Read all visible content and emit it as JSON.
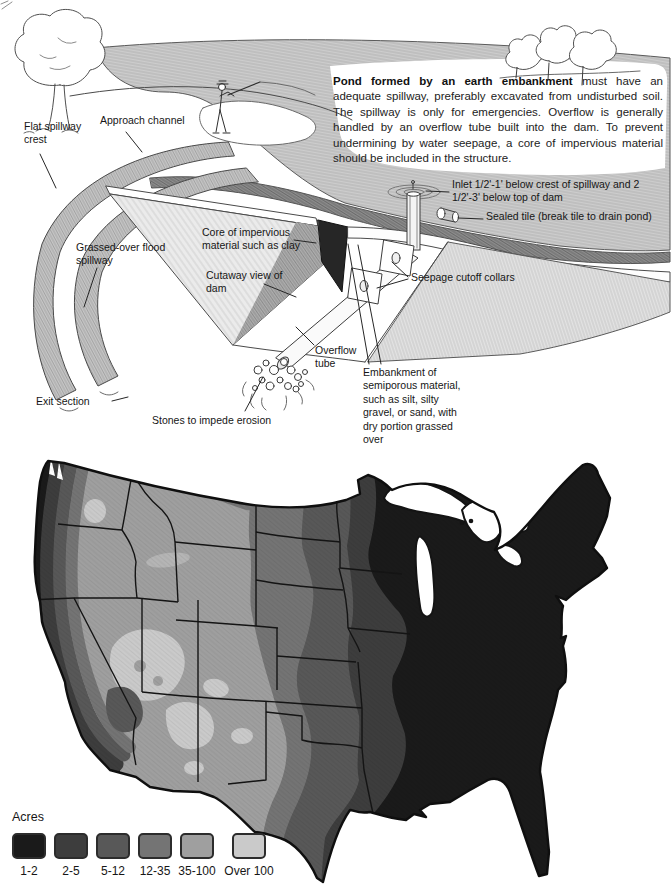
{
  "figure": {
    "caption": {
      "lead": "Pond formed by an earth embankment",
      "body": " must have an adequate spillway, preferably excavated from undisturbed soil. The spillway is only for emergencies. Overflow is generally handled by an overflow tube built into the dam. To prevent undermining by water seepage, a core of impervious material should be included in the structure."
    },
    "labels": {
      "flat_spillway_crest": "Flat spillway crest",
      "approach_channel": "Approach channel",
      "grassed_over_flood_spillway": "Grassed-over flood spillway",
      "exit_section": "Exit section",
      "core_of_impervious": "Core of impervious material such as clay",
      "cutaway_view": "Cutaway view of dam",
      "overflow_tube": "Overflow tube",
      "stones": "Stones to impede erosion",
      "embankment": "Embankment of semiporous material, such as silt, silty gravel, or sand, with dry portion grassed over",
      "inlet": "Inlet 1/2'-1' below crest of spillway and 2 1/2'-3' below top of dam",
      "sealed_tile": "Sealed tile (break tile to drain pond)",
      "seepage_collars": "Seepage cutoff collars"
    }
  },
  "map": {
    "legend": {
      "title": "Acres",
      "classes": [
        {
          "label": "1-2",
          "color": "#1a1a1a"
        },
        {
          "label": "2-5",
          "color": "#3d3d3d"
        },
        {
          "label": "5-12",
          "color": "#585858"
        },
        {
          "label": "12-35",
          "color": "#747474"
        },
        {
          "label": "35-100",
          "color": "#9f9f9f"
        },
        {
          "label": "Over 100",
          "color": "#cacaca"
        }
      ]
    }
  }
}
